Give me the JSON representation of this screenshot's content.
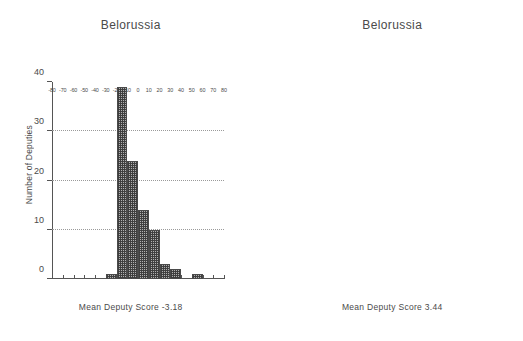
{
  "figure": {
    "background_color": "#ffffff",
    "bar_fill_color": "#b0b0b0",
    "bar_edge_color": "#4a4a4a",
    "grid_color": "#9a9a9a",
    "axis_color": "#555555",
    "text_color": "#4a4a4a"
  },
  "panels": [
    {
      "key": "left",
      "title": "Belorussia",
      "xlabel": "Mean Deputy Score -3.18",
      "ylabel": "Number of Deputies"
    },
    {
      "key": "right",
      "title": "Belorussia",
      "xlabel": "Mean Deputy Score 3.44",
      "ylabel": "Number of Deputies"
    }
  ],
  "chart_data": [
    {
      "type": "bar",
      "subtype": "histogram",
      "title": "Belorussia",
      "xlabel": "Mean Deputy Score -3.18",
      "ylabel": "Number of Deputies",
      "mean_deputy_score": -3.18,
      "xlim": [
        -80,
        80
      ],
      "ylim": [
        0,
        40
      ],
      "bin_width": 10,
      "grid": true,
      "grid_axis": "y",
      "legend": "none",
      "xticks": [
        -80,
        -70,
        -60,
        -50,
        -40,
        -30,
        -20,
        -10,
        0,
        10,
        20,
        30,
        40,
        50,
        60,
        70,
        80
      ],
      "xticklabels": [
        "-80",
        "-70",
        "-60",
        "-50",
        "-40",
        "-30",
        "-20",
        "-10",
        "0",
        "10",
        "20",
        "30",
        "40",
        "50",
        "60",
        "70",
        "80"
      ],
      "yticks": [
        0,
        10,
        20,
        30,
        40
      ],
      "yticklabels": [
        "0",
        "10",
        "20",
        "30",
        "40"
      ],
      "bin_edges": [
        -30,
        -20,
        -10,
        0,
        10,
        20,
        30,
        40,
        50,
        60
      ],
      "bins": [
        {
          "start": -30,
          "end": -20,
          "value": 1
        },
        {
          "start": -20,
          "end": -10,
          "value": 39
        },
        {
          "start": -10,
          "end": 0,
          "value": 24
        },
        {
          "start": 0,
          "end": 10,
          "value": 14
        },
        {
          "start": 10,
          "end": 20,
          "value": 10
        },
        {
          "start": 20,
          "end": 30,
          "value": 3
        },
        {
          "start": 30,
          "end": 40,
          "value": 2
        },
        {
          "start": 40,
          "end": 50,
          "value": 0
        },
        {
          "start": 50,
          "end": 60,
          "value": 1
        }
      ],
      "categories": [
        "-30",
        "-20",
        "-10",
        "0",
        "10",
        "20",
        "30",
        "40",
        "50"
      ],
      "values": [
        1,
        39,
        24,
        14,
        10,
        3,
        2,
        0,
        1
      ]
    },
    {
      "type": "bar",
      "subtype": "histogram",
      "title": "Belorussia",
      "xlabel": "Mean Deputy Score 3.44",
      "ylabel": "Number of Deputies",
      "mean_deputy_score": 3.44,
      "xlim": [
        -80,
        80
      ],
      "ylim": [
        0,
        50
      ],
      "bin_width": 10,
      "grid": true,
      "grid_axis": "y",
      "legend": "none",
      "xticks": [
        -80,
        -70,
        -60,
        -50,
        -40,
        -30,
        -20,
        -10,
        0,
        10,
        20,
        30,
        40,
        50,
        60,
        70,
        80
      ],
      "xticklabels": [
        "-80",
        "-70",
        "-60",
        "-50",
        "-40",
        "-30",
        "-20",
        "-10",
        "0",
        "10",
        "20",
        "30",
        "40",
        "50",
        "60",
        "70",
        "80"
      ],
      "yticks": [
        0,
        10,
        20,
        30,
        40,
        50
      ],
      "yticklabels": [
        "0",
        "10",
        "20",
        "30",
        "40",
        "50"
      ],
      "bin_edges": [
        -20,
        -10,
        0,
        10,
        20,
        30
      ],
      "bins": [
        {
          "start": -20,
          "end": -10,
          "value": 2
        },
        {
          "start": -10,
          "end": 0,
          "value": 26
        },
        {
          "start": 0,
          "end": 10,
          "value": 45
        },
        {
          "start": 10,
          "end": 20,
          "value": 19
        },
        {
          "start": 20,
          "end": 30,
          "value": 2
        }
      ],
      "categories": [
        "-20",
        "-10",
        "0",
        "10",
        "20"
      ],
      "values": [
        2,
        26,
        45,
        19,
        2
      ]
    }
  ]
}
